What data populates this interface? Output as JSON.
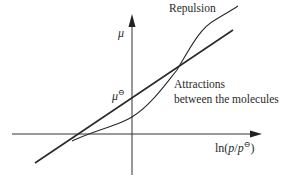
{
  "diagram": {
    "type": "chemical potential vs ln pressure",
    "axes": {
      "y_label": "μ",
      "x_label_prefix": "ln(",
      "x_label_p": "p",
      "x_label_slash": "/",
      "x_label_p2": "p",
      "x_label_sup": "⊖",
      "x_label_suffix": ")"
    },
    "labels": {
      "repulsion": "Repulsion",
      "attractions_line1": "Attractions",
      "attractions_line2": "between the molecules",
      "mu_standard": "μ",
      "mu_standard_sup": "⊖"
    },
    "curves": [
      {
        "name": "perfect-gas",
        "shape": "straight line",
        "description": "ideal gas μ = μ⊖ + RT ln(p/p⊖)"
      },
      {
        "name": "real-gas",
        "shape": "S-shaped curve",
        "description": "below ideal line where attractions dominate, above where repulsion dominates"
      }
    ],
    "colors": {
      "line": "#2a2a2a",
      "background": "#ffffff"
    }
  }
}
